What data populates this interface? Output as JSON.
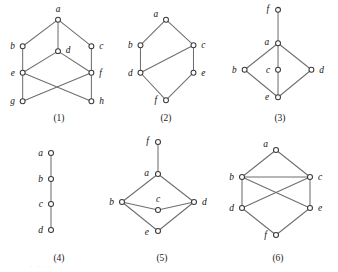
{
  "figure": {
    "background_color": "#ffffff",
    "edge_color": "#6e6e6e",
    "node_stroke_color": "#3a3a3a",
    "node_fill_color": "#ffffff",
    "label_color": "#111111",
    "bottom_artifact_text": "· ·· ·"
  },
  "diagrams": [
    {
      "caption": "(1)",
      "cell": {
        "x": 0,
        "y": 4,
        "w": 118,
        "h": 124
      },
      "viewbox": "0 0 118 110",
      "nodes": [
        {
          "id": "a",
          "label": "a",
          "x": 58,
          "y": 16,
          "lx": 58,
          "ly": 8,
          "anchor": "middle"
        },
        {
          "id": "b",
          "label": "b",
          "x": 22,
          "y": 43,
          "lx": 14,
          "ly": 46,
          "anchor": "end"
        },
        {
          "id": "c",
          "label": "c",
          "x": 92,
          "y": 43,
          "lx": 100,
          "ly": 46,
          "anchor": "start"
        },
        {
          "id": "d",
          "label": "d",
          "x": 58,
          "y": 48,
          "lx": 66,
          "ly": 50,
          "anchor": "start"
        },
        {
          "id": "e",
          "label": "e",
          "x": 22,
          "y": 70,
          "lx": 14,
          "ly": 73,
          "anchor": "end"
        },
        {
          "id": "f",
          "label": "f",
          "x": 92,
          "y": 70,
          "lx": 100,
          "ly": 73,
          "anchor": "start"
        },
        {
          "id": "g",
          "label": "g",
          "x": 22,
          "y": 99,
          "lx": 14,
          "ly": 102,
          "anchor": "end"
        },
        {
          "id": "h",
          "label": "h",
          "x": 92,
          "y": 99,
          "lx": 100,
          "ly": 102,
          "anchor": "start"
        }
      ],
      "edges": [
        [
          "a",
          "b"
        ],
        [
          "a",
          "d"
        ],
        [
          "a",
          "c"
        ],
        [
          "b",
          "e"
        ],
        [
          "c",
          "f"
        ],
        [
          "d",
          "e"
        ],
        [
          "d",
          "f"
        ],
        [
          "e",
          "g"
        ],
        [
          "e",
          "h"
        ],
        [
          "f",
          "g"
        ],
        [
          "f",
          "h"
        ]
      ]
    },
    {
      "caption": "(2)",
      "cell": {
        "x": 110,
        "y": 4,
        "w": 112,
        "h": 124
      },
      "viewbox": "0 0 112 110",
      "nodes": [
        {
          "id": "a",
          "label": "a",
          "x": 56,
          "y": 16,
          "lx": 48,
          "ly": 13,
          "anchor": "end"
        },
        {
          "id": "b",
          "label": "b",
          "x": 30,
          "y": 42,
          "lx": 22,
          "ly": 45,
          "anchor": "end"
        },
        {
          "id": "c",
          "label": "c",
          "x": 84,
          "y": 42,
          "lx": 92,
          "ly": 45,
          "anchor": "start"
        },
        {
          "id": "d",
          "label": "d",
          "x": 30,
          "y": 70,
          "lx": 22,
          "ly": 73,
          "anchor": "end"
        },
        {
          "id": "e",
          "label": "e",
          "x": 84,
          "y": 70,
          "lx": 92,
          "ly": 73,
          "anchor": "start"
        },
        {
          "id": "f",
          "label": "f",
          "x": 56,
          "y": 98,
          "lx": 47,
          "ly": 101,
          "anchor": "end"
        }
      ],
      "edges": [
        [
          "a",
          "b"
        ],
        [
          "a",
          "c"
        ],
        [
          "b",
          "d"
        ],
        [
          "d",
          "c"
        ],
        [
          "c",
          "e"
        ],
        [
          "d",
          "f"
        ],
        [
          "e",
          "f"
        ]
      ]
    },
    {
      "caption": "(3)",
      "cell": {
        "x": 222,
        "y": 0,
        "w": 116,
        "h": 128
      },
      "viewbox": "0 0 116 114",
      "nodes": [
        {
          "id": "f",
          "label": "f",
          "x": 56,
          "y": 10,
          "lx": 47,
          "ly": 12,
          "anchor": "end"
        },
        {
          "id": "a",
          "label": "a",
          "x": 56,
          "y": 44,
          "lx": 47,
          "ly": 46,
          "anchor": "end"
        },
        {
          "id": "b",
          "label": "b",
          "x": 22,
          "y": 71,
          "lx": 14,
          "ly": 74,
          "anchor": "end"
        },
        {
          "id": "c",
          "label": "c",
          "x": 56,
          "y": 71,
          "lx": 48,
          "ly": 74,
          "anchor": "end"
        },
        {
          "id": "d",
          "label": "d",
          "x": 90,
          "y": 71,
          "lx": 98,
          "ly": 74,
          "anchor": "start"
        },
        {
          "id": "e",
          "label": "e",
          "x": 56,
          "y": 99,
          "lx": 47,
          "ly": 102,
          "anchor": "end"
        }
      ],
      "edges": [
        [
          "f",
          "a"
        ],
        [
          "a",
          "b"
        ],
        [
          "a",
          "c"
        ],
        [
          "a",
          "d"
        ],
        [
          "b",
          "e"
        ],
        [
          "c",
          "e"
        ],
        [
          "d",
          "e"
        ]
      ]
    },
    {
      "caption": "(4)",
      "cell": {
        "x": 0,
        "y": 140,
        "w": 118,
        "h": 128
      },
      "viewbox": "0 0 118 112",
      "nodes": [
        {
          "id": "a",
          "label": "a",
          "x": 51,
          "y": 13,
          "lx": 43,
          "ly": 16,
          "anchor": "end"
        },
        {
          "id": "b",
          "label": "b",
          "x": 51,
          "y": 39,
          "lx": 43,
          "ly": 42,
          "anchor": "end"
        },
        {
          "id": "c",
          "label": "c",
          "x": 51,
          "y": 64,
          "lx": 43,
          "ly": 67,
          "anchor": "end"
        },
        {
          "id": "d",
          "label": "d",
          "x": 51,
          "y": 90,
          "lx": 43,
          "ly": 93,
          "anchor": "end"
        }
      ],
      "edges": [
        [
          "a",
          "b"
        ],
        [
          "b",
          "c"
        ],
        [
          "c",
          "d"
        ]
      ]
    },
    {
      "caption": "(5)",
      "cell": {
        "x": 104,
        "y": 132,
        "w": 116,
        "h": 136
      },
      "viewbox": "0 0 116 120",
      "nodes": [
        {
          "id": "f",
          "label": "f",
          "x": 54,
          "y": 10,
          "lx": 45,
          "ly": 12,
          "anchor": "end"
        },
        {
          "id": "a",
          "label": "a",
          "x": 54,
          "y": 42,
          "lx": 45,
          "ly": 44,
          "anchor": "end"
        },
        {
          "id": "b",
          "label": "b",
          "x": 18,
          "y": 70,
          "lx": 10,
          "ly": 73,
          "anchor": "end"
        },
        {
          "id": "c",
          "label": "c",
          "x": 54,
          "y": 78,
          "lx": 54,
          "ly": 70,
          "anchor": "middle"
        },
        {
          "id": "d",
          "label": "d",
          "x": 90,
          "y": 70,
          "lx": 98,
          "ly": 73,
          "anchor": "start"
        },
        {
          "id": "e",
          "label": "e",
          "x": 54,
          "y": 99,
          "lx": 45,
          "ly": 103,
          "anchor": "end"
        }
      ],
      "edges": [
        [
          "f",
          "a"
        ],
        [
          "a",
          "b"
        ],
        [
          "a",
          "d"
        ],
        [
          "b",
          "c"
        ],
        [
          "c",
          "d"
        ],
        [
          "b",
          "e"
        ],
        [
          "e",
          "d"
        ]
      ]
    },
    {
      "caption": "(6)",
      "cell": {
        "x": 218,
        "y": 132,
        "w": 120,
        "h": 136
      },
      "viewbox": "0 0 120 120",
      "nodes": [
        {
          "id": "a",
          "label": "a",
          "x": 58,
          "y": 18,
          "lx": 50,
          "ly": 15,
          "anchor": "end"
        },
        {
          "id": "b",
          "label": "b",
          "x": 24,
          "y": 45,
          "lx": 16,
          "ly": 48,
          "anchor": "end"
        },
        {
          "id": "c",
          "label": "c",
          "x": 92,
          "y": 45,
          "lx": 100,
          "ly": 48,
          "anchor": "start"
        },
        {
          "id": "d",
          "label": "d",
          "x": 24,
          "y": 76,
          "lx": 16,
          "ly": 79,
          "anchor": "end"
        },
        {
          "id": "e",
          "label": "e",
          "x": 92,
          "y": 76,
          "lx": 100,
          "ly": 79,
          "anchor": "start"
        },
        {
          "id": "f",
          "label": "f",
          "x": 58,
          "y": 103,
          "lx": 49,
          "ly": 106,
          "anchor": "end"
        }
      ],
      "edges": [
        [
          "a",
          "b"
        ],
        [
          "a",
          "c"
        ],
        [
          "b",
          "c"
        ],
        [
          "b",
          "d"
        ],
        [
          "c",
          "e"
        ],
        [
          "b",
          "e"
        ],
        [
          "c",
          "d"
        ],
        [
          "d",
          "f"
        ],
        [
          "e",
          "f"
        ]
      ]
    }
  ]
}
